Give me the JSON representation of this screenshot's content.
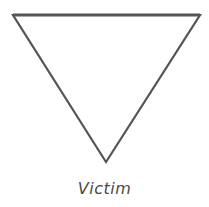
{
  "diagram": {
    "shape": "inverted-triangle",
    "stroke_color": "#555555",
    "label": "Victim"
  }
}
